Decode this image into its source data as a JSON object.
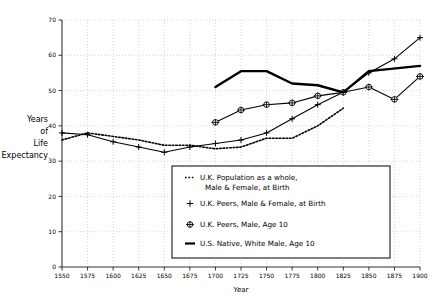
{
  "chart_data": {
    "type": "line",
    "title": "",
    "xlabel": "Year",
    "ylabel": "Years of Life Expectancy",
    "ylabel_lines": [
      "Years",
      "of",
      "Life",
      "Expectancy"
    ],
    "xlim": [
      1550,
      1900
    ],
    "ylim": [
      0,
      70
    ],
    "xticks": [
      1550,
      1575,
      1600,
      1625,
      1650,
      1675,
      1700,
      1725,
      1750,
      1775,
      1800,
      1825,
      1850,
      1875,
      1900
    ],
    "yticks": [
      0,
      10,
      20,
      30,
      40,
      50,
      60,
      70
    ],
    "xtick_labels": [
      "1550",
      "1575",
      "1600",
      "1625",
      "1650",
      "1675",
      "1700",
      "1725",
      "1750",
      "1775",
      "1800",
      "1825",
      "1850",
      "1875",
      "1900"
    ],
    "ytick_labels": [
      "0",
      "10",
      "20",
      "30",
      "40",
      "50",
      "60",
      "70"
    ],
    "grid": true,
    "grid_style": "dotted",
    "legend_position": "inside-bottom-center",
    "series": [
      {
        "name": "U.K. Population as a whole, Male & Female, at Birth",
        "marker": "none",
        "line_style": "dotted",
        "color": "#000000",
        "x": [
          1550,
          1575,
          1600,
          1625,
          1650,
          1675,
          1700,
          1725,
          1750,
          1775,
          1800,
          1825
        ],
        "values": [
          36.0,
          38.0,
          37.0,
          36.0,
          34.5,
          34.5,
          33.5,
          34.0,
          36.5,
          36.5,
          40.0,
          45.0
        ]
      },
      {
        "name": "U.K. Peers, Male & Female, at Birth",
        "marker": "plus",
        "line_style": "solid",
        "color": "#000000",
        "x": [
          1550,
          1575,
          1600,
          1625,
          1650,
          1675,
          1700,
          1725,
          1750,
          1775,
          1800,
          1825,
          1850,
          1875,
          1900
        ],
        "values": [
          38.0,
          37.5,
          35.5,
          34.0,
          32.5,
          34.0,
          35.0,
          36.0,
          38.0,
          42.0,
          46.0,
          49.5,
          55.0,
          59.0,
          65.0
        ]
      },
      {
        "name": "U.K. Peers, Male, Age 10",
        "marker": "circle-cross",
        "line_style": "solid",
        "color": "#000000",
        "x": [
          1700,
          1725,
          1750,
          1775,
          1800,
          1825,
          1850,
          1875,
          1900
        ],
        "values": [
          41.0,
          44.5,
          46.0,
          46.5,
          48.5,
          49.5,
          51.0,
          47.5,
          54.0
        ]
      },
      {
        "name": "U.S. Native, White Male, Age 10",
        "marker": "none",
        "line_style": "solid-thick",
        "color": "#000000",
        "x": [
          1700,
          1725,
          1750,
          1775,
          1800,
          1825,
          1850,
          1900
        ],
        "values": [
          51.0,
          55.5,
          55.5,
          52.0,
          51.5,
          49.5,
          55.5,
          57.0
        ]
      }
    ],
    "legend_entries": [
      {
        "marker": "dotted",
        "label_line1": "U.K. Population as a whole,",
        "label_line2": "Male & Female, at Birth"
      },
      {
        "marker": "plus",
        "label_line1": "U.K. Peers, Male & Female, at Birth",
        "label_line2": ""
      },
      {
        "marker": "circle-cross",
        "label_line1": "U.K. Peers, Male, Age 10",
        "label_line2": ""
      },
      {
        "marker": "solid",
        "label_line1": "U.S. Native, White Male, Age 10",
        "label_line2": ""
      }
    ]
  }
}
